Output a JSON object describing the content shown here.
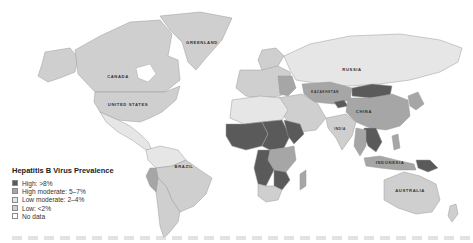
{
  "map": {
    "type": "choropleth world map",
    "country_labels": {
      "greenland": "GREENLAND",
      "canada": "CANADA",
      "united_states": "UNITED STATES",
      "brazil": "BRAZIL",
      "russia": "RUSSIA",
      "kazakhstan": "KAZAKHSTAN",
      "china": "CHINA",
      "india": "INDIA",
      "indonesia": "INDONESIA",
      "australia": "AUSTRALIA"
    },
    "colors": {
      "high": "#5a5a5a",
      "high_moderate": "#a6a6a6",
      "low_moderate": "#e6e6e6",
      "low": "#cfcfcf",
      "no_data": "#f6f6f6"
    }
  },
  "legend": {
    "title": "Hepatitis B Virus Prevalence",
    "items": [
      {
        "key": "high",
        "label": "High: >8%"
      },
      {
        "key": "high_moderate",
        "label": "High moderate: 5–7%"
      },
      {
        "key": "low_moderate",
        "label": "Low moderate: 2–4%"
      },
      {
        "key": "low",
        "label": "Low: <2%"
      },
      {
        "key": "no_data",
        "label": "No data"
      }
    ]
  }
}
